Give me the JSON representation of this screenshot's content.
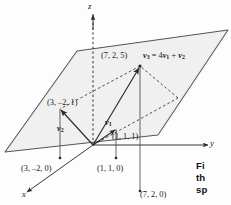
{
  "figure": {
    "kind": "3d-vector-span-diagram",
    "axes": [
      {
        "name": "z-axis",
        "label": "z",
        "direction": "up"
      },
      {
        "name": "y-axis",
        "label": "y",
        "direction": "right"
      },
      {
        "name": "x-axis",
        "label": "x",
        "direction": "lower-left"
      }
    ],
    "plane": {
      "name": "span-plane",
      "fill": "#f0f0f0",
      "stroke": "#555555",
      "description": "shaded parallelogram representing the span of v1 and v2"
    },
    "equation": {
      "text": "v3 = 4v1 + v2",
      "lhs": "v",
      "lhs_sub": "3",
      "rel": " = 4",
      "t1": "v",
      "t1_sub": "1",
      "plus": " + ",
      "t2": "v",
      "t2_sub": "2"
    },
    "vectors": [
      {
        "name": "v1",
        "symbol": "v",
        "subscript": "1",
        "tip_point": "(1, 1, 1)"
      },
      {
        "name": "v2",
        "symbol": "v",
        "subscript": "2",
        "tip_point": "(3, -2, 1)"
      },
      {
        "name": "v3",
        "symbol": "v",
        "subscript": "3",
        "tip_point": "(7, 2, 5)"
      }
    ],
    "point_labels": [
      {
        "name": "point-label-v3-tip",
        "text": "(7, 2, 5)"
      },
      {
        "name": "point-label-v2-tip",
        "text": "(3, –2, 1)"
      },
      {
        "name": "point-label-v1-tip",
        "text": "(1, 1, 1)"
      },
      {
        "name": "point-label-v2-foot",
        "text": "(3, –2, 0)"
      },
      {
        "name": "point-label-v1-foot",
        "text": "(1, 1, 0)"
      },
      {
        "name": "point-label-v3-foot",
        "text": "(7, 2, 0)"
      }
    ],
    "colors": {
      "ink": "#1a1a1a",
      "line": "#555555",
      "plane_fill": "#f0f0f0",
      "dashed": "#3a3a3a"
    }
  },
  "caption": {
    "name": "figure-caption",
    "lines": [
      "Fi",
      "th",
      "sp"
    ]
  }
}
